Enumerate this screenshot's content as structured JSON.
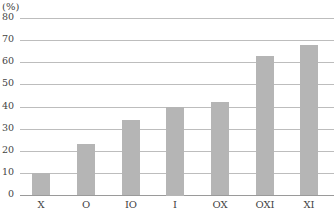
{
  "chart_data": {
    "type": "bar",
    "title": "",
    "unit_label": "(%)",
    "xlabel": "",
    "ylabel": "(%)",
    "ylim": [
      0,
      80
    ],
    "yticks": [
      0,
      10,
      20,
      30,
      40,
      50,
      60,
      70,
      80
    ],
    "grid": true,
    "legend": null,
    "categories": [
      "X",
      "O",
      "IO",
      "I",
      "OX",
      "OXI",
      "XI"
    ],
    "values": [
      10,
      23,
      34,
      40,
      42,
      63,
      68
    ],
    "bar_color": "#b5b5b5"
  }
}
